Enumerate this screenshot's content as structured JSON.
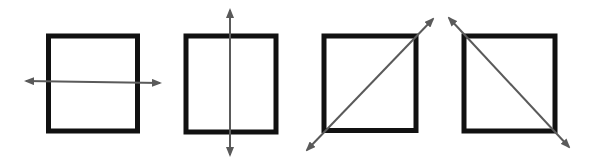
{
  "colors": {
    "background": "#ffffff",
    "square_stroke": "#111111",
    "arrow": "#5a5a5a"
  },
  "figures": [
    {
      "name": "square-horizontal-line",
      "line_of_symmetry": "horizontal",
      "square": {
        "x": 48.5,
        "y": 36,
        "w": 89,
        "h": 95
      },
      "arrow": {
        "x1": 26,
        "y1": 81,
        "x2": 160,
        "y2": 83
      }
    },
    {
      "name": "square-vertical-line",
      "line_of_symmetry": "vertical",
      "square": {
        "x": 186,
        "y": 36,
        "w": 90,
        "h": 96
      },
      "arrow": {
        "x1": 230,
        "y1": 10,
        "x2": 230,
        "y2": 155
      }
    },
    {
      "name": "square-diagonal-up-line",
      "line_of_symmetry": "diagonal-ascending",
      "square": {
        "x": 324,
        "y": 36,
        "w": 92,
        "h": 94.5
      },
      "arrow": {
        "x1": 307,
        "y1": 150,
        "x2": 433,
        "y2": 19
      }
    },
    {
      "name": "square-diagonal-down-line",
      "line_of_symmetry": "diagonal-descending",
      "square": {
        "x": 464,
        "y": 36,
        "w": 91,
        "h": 95
      },
      "arrow": {
        "x1": 449,
        "y1": 18,
        "x2": 569,
        "y2": 147
      }
    }
  ]
}
